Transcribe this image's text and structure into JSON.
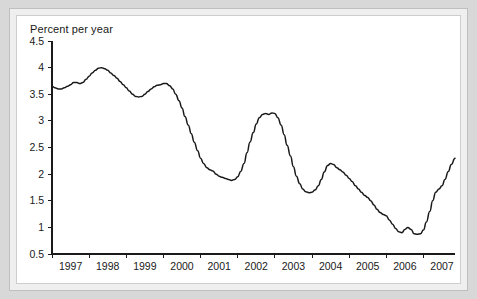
{
  "chart_data": {
    "type": "line",
    "title": "",
    "subtitle": "",
    "ylabel": "Percent per year",
    "xlabel": "",
    "ylim": [
      0.5,
      4.5
    ],
    "xlim": [
      1997.0,
      2007.85
    ],
    "grid": false,
    "legend": null,
    "line_color": "#1a1a1a",
    "yticks": [
      "0.5",
      "1",
      "1.5",
      "2",
      "2.5",
      "3",
      "3.5",
      "4",
      "4.5"
    ],
    "ytick_values": [
      0.5,
      1,
      1.5,
      2,
      2.5,
      3,
      3.5,
      4,
      4.5
    ],
    "xticks": [
      "1997",
      "1998",
      "1999",
      "2000",
      "2001",
      "2002",
      "2003",
      "2004",
      "2005",
      "2006",
      "2007"
    ],
    "xtick_values": [
      1997,
      1998,
      1999,
      2000,
      2001,
      2002,
      2003,
      2004,
      2005,
      2006,
      2007
    ],
    "series": [
      {
        "name": "Percent per year",
        "x": [
          1997.0,
          1997.08,
          1997.17,
          1997.25,
          1997.33,
          1997.42,
          1997.5,
          1997.58,
          1997.67,
          1997.75,
          1997.83,
          1997.92,
          1998.0,
          1998.08,
          1998.17,
          1998.25,
          1998.33,
          1998.42,
          1998.5,
          1998.58,
          1998.67,
          1998.75,
          1998.83,
          1998.92,
          1999.0,
          1999.08,
          1999.17,
          1999.25,
          1999.33,
          1999.42,
          1999.5,
          1999.58,
          1999.67,
          1999.75,
          1999.83,
          1999.92,
          2000.0,
          2000.08,
          2000.17,
          2000.25,
          2000.33,
          2000.42,
          2000.5,
          2000.58,
          2000.67,
          2000.75,
          2000.83,
          2000.92,
          2001.0,
          2001.08,
          2001.17,
          2001.25,
          2001.33,
          2001.42,
          2001.5,
          2001.58,
          2001.67,
          2001.75,
          2001.83,
          2001.92,
          2002.0,
          2002.08,
          2002.17,
          2002.25,
          2002.33,
          2002.42,
          2002.5,
          2002.58,
          2002.67,
          2002.75,
          2002.83,
          2002.92,
          2003.0,
          2003.08,
          2003.17,
          2003.25,
          2003.33,
          2003.42,
          2003.5,
          2003.58,
          2003.67,
          2003.75,
          2003.83,
          2003.92,
          2004.0,
          2004.08,
          2004.17,
          2004.25,
          2004.33,
          2004.42,
          2004.5,
          2004.58,
          2004.67,
          2004.75,
          2004.83,
          2004.92,
          2005.0,
          2005.08,
          2005.17,
          2005.25,
          2005.33,
          2005.42,
          2005.5,
          2005.58,
          2005.67,
          2005.75,
          2005.83,
          2005.92,
          2006.0,
          2006.08,
          2006.17,
          2006.25,
          2006.33,
          2006.42,
          2006.5,
          2006.58,
          2006.67,
          2006.75,
          2006.83,
          2006.92,
          2007.0,
          2007.08,
          2007.17,
          2007.25,
          2007.33,
          2007.42,
          2007.5,
          2007.58,
          2007.67,
          2007.75,
          2007.85
        ],
        "y": [
          3.65,
          3.62,
          3.6,
          3.6,
          3.62,
          3.65,
          3.68,
          3.72,
          3.72,
          3.7,
          3.72,
          3.78,
          3.84,
          3.9,
          3.95,
          3.99,
          4.0,
          3.98,
          3.95,
          3.9,
          3.85,
          3.8,
          3.74,
          3.68,
          3.62,
          3.56,
          3.5,
          3.46,
          3.45,
          3.46,
          3.5,
          3.55,
          3.6,
          3.64,
          3.67,
          3.68,
          3.7,
          3.7,
          3.66,
          3.6,
          3.5,
          3.38,
          3.24,
          3.08,
          2.92,
          2.76,
          2.6,
          2.44,
          2.3,
          2.2,
          2.12,
          2.08,
          2.06,
          2.0,
          1.96,
          1.94,
          1.92,
          1.9,
          1.88,
          1.9,
          1.95,
          2.05,
          2.2,
          2.4,
          2.6,
          2.78,
          2.94,
          3.06,
          3.12,
          3.14,
          3.12,
          3.15,
          3.14,
          3.06,
          2.92,
          2.74,
          2.54,
          2.34,
          2.14,
          1.96,
          1.82,
          1.72,
          1.67,
          1.65,
          1.66,
          1.7,
          1.78,
          1.9,
          2.04,
          2.16,
          2.2,
          2.18,
          2.12,
          2.08,
          2.04,
          1.98,
          1.92,
          1.86,
          1.78,
          1.72,
          1.66,
          1.6,
          1.56,
          1.5,
          1.42,
          1.34,
          1.28,
          1.24,
          1.22,
          1.14,
          1.06,
          0.98,
          0.92,
          0.9,
          0.96,
          1.0,
          0.96,
          0.88,
          0.87,
          0.88,
          0.95,
          1.1,
          1.3,
          1.5,
          1.66,
          1.72,
          1.78,
          1.9,
          2.05,
          2.18,
          2.3
        ]
      }
    ]
  }
}
